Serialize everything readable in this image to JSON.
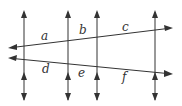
{
  "diagram": {
    "type": "parallel lines with transversals",
    "colors": {
      "line": "#333333",
      "background": "#ffffff"
    },
    "vertical_lines": [
      {
        "id": "v1",
        "x": 24
      },
      {
        "id": "v2",
        "x": 68
      },
      {
        "id": "v3",
        "x": 97
      },
      {
        "id": "v4",
        "x": 155
      }
    ],
    "transversals": [
      {
        "id": "upper",
        "from": [
          8,
          48
        ],
        "to": [
          172,
          28
        ]
      },
      {
        "id": "lower",
        "from": [
          8,
          58
        ],
        "to": [
          172,
          74
        ]
      }
    ],
    "labels": {
      "a": "a",
      "b": "b",
      "c": "c",
      "d": "d",
      "e": "e",
      "f": "f"
    }
  }
}
